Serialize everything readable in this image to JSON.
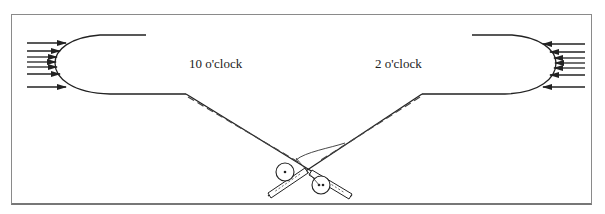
{
  "diagram": {
    "type": "fly casting stroke illustration",
    "labels": {
      "left_position": "10 o'clock",
      "right_position": "2 o'clock"
    },
    "elements": [
      {
        "name": "back-cast-line-loop",
        "side": "left",
        "arrow_direction": "right",
        "arrow_count": 7
      },
      {
        "name": "forward-cast-line-loop",
        "side": "right",
        "arrow_direction": "left",
        "arrow_count": 7
      },
      {
        "name": "rod-at-10-oclock",
        "reel": true
      },
      {
        "name": "rod-at-2-oclock",
        "reel": true
      }
    ],
    "colors": {
      "line": "#222222",
      "frame": "#8a8a8a",
      "background": "#ffffff"
    }
  }
}
